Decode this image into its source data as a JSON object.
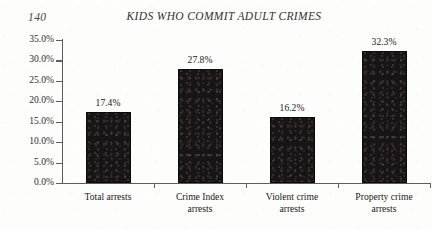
{
  "page": {
    "folio": "140"
  },
  "chart_data": {
    "type": "bar",
    "title": "KIDS WHO COMMIT ADULT CRIMES",
    "xlabel": "",
    "ylabel": "",
    "categories": [
      "Total arrests",
      "Crime Index arrests",
      "Violent crime arrests",
      "Property crime arrests"
    ],
    "category_lines": [
      [
        "Total arrests"
      ],
      [
        "Crime Index",
        "arrests"
      ],
      [
        "Violent crime",
        "arrests"
      ],
      [
        "Property crime",
        "arrests"
      ]
    ],
    "values": [
      17.4,
      27.8,
      16.2,
      32.3
    ],
    "value_labels": [
      "17.4%",
      "27.8%",
      "16.2%",
      "32.3%"
    ],
    "ylim": [
      0,
      35
    ],
    "ytick_values": [
      0,
      5,
      10,
      15,
      20,
      25,
      30,
      35
    ],
    "ytick_labels": [
      "0.0%",
      "5.0%",
      "10.0%",
      "15.0%",
      "20.0%",
      "25.0%",
      "30.0%",
      "35.0%"
    ],
    "grid": false,
    "legend": false,
    "bar_color": "#191416",
    "axis_color": "#5d5d5d",
    "text_color": "#222222",
    "background_color": "#fdfdfb"
  }
}
